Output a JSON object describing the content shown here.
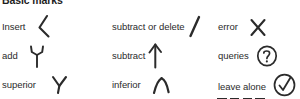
{
  "sheet": {
    "heading": "Basic marks",
    "background_color": "#ffffff",
    "ink_color": "#2b2b2b",
    "note": "Proofreading / copy-editing mark reference chart, 3 columns x 3 rows"
  },
  "rows": [
    {
      "cells": [
        {
          "label": "Insert",
          "mark": "insert-caret-mark"
        },
        {
          "label": "subtract or delete",
          "mark": "slash-delete-mark"
        },
        {
          "label": "error",
          "mark": "x-cross-mark"
        }
      ]
    },
    {
      "cells": [
        {
          "label": "add",
          "mark": "y-add-mark"
        },
        {
          "label": "subtract",
          "mark": "up-arrow-subtract-mark"
        },
        {
          "label": "queries",
          "mark": "circled-question-mark"
        }
      ]
    },
    {
      "cells": [
        {
          "label": "superior",
          "mark": "y-superior-mark"
        },
        {
          "label": "inferior",
          "mark": "inverted-caret-inferior-mark"
        },
        {
          "label": "leave alone",
          "mark": "circled-check-mark",
          "underline": "stet-dashed-underline"
        }
      ]
    }
  ]
}
